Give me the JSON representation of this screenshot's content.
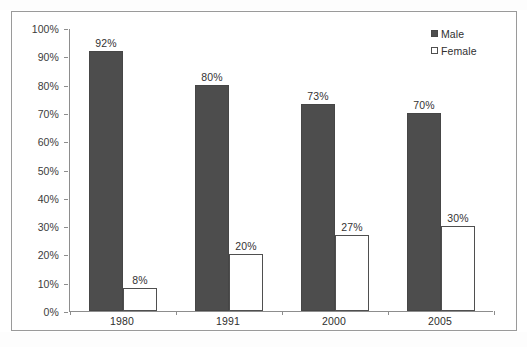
{
  "chart_data": {
    "type": "bar",
    "title": "",
    "subtitle": "",
    "xlabel": "",
    "ylabel": "",
    "categories": [
      "1980",
      "1991",
      "2000",
      "2005"
    ],
    "series": [
      {
        "name": "Male",
        "color": "#4d4d4d",
        "values": [
          92,
          80,
          73,
          70
        ],
        "value_labels": [
          "92%",
          "80%",
          "73%",
          "70%"
        ]
      },
      {
        "name": "Female",
        "color": "#ffffff",
        "values": [
          8,
          20,
          27,
          30
        ],
        "value_labels": [
          "8%",
          "20%",
          "27%",
          "30%"
        ]
      }
    ],
    "ylim": [
      0,
      100
    ],
    "ytick_values": [
      0,
      10,
      20,
      30,
      40,
      50,
      60,
      70,
      80,
      90,
      100
    ],
    "ytick_labels": [
      "0%",
      "10%",
      "20%",
      "30%",
      "40%",
      "50%",
      "60%",
      "70%",
      "80%",
      "90%",
      "100%"
    ],
    "grid": false,
    "legend_position": "top-right",
    "value_labels_shown": true
  },
  "axes": {
    "y": {
      "ticks": [
        {
          "label": "100%",
          "value": 100
        },
        {
          "label": "90%",
          "value": 90
        },
        {
          "label": "80%",
          "value": 80
        },
        {
          "label": "70%",
          "value": 70
        },
        {
          "label": "60%",
          "value": 60
        },
        {
          "label": "50%",
          "value": 50
        },
        {
          "label": "40%",
          "value": 40
        },
        {
          "label": "30%",
          "value": 30
        },
        {
          "label": "20%",
          "value": 20
        },
        {
          "label": "10%",
          "value": 10
        },
        {
          "label": "0%",
          "value": 0
        }
      ]
    },
    "x": {
      "ticks": [
        {
          "label": "1980"
        },
        {
          "label": "1991"
        },
        {
          "label": "2000"
        },
        {
          "label": "2005"
        }
      ]
    }
  },
  "legend": {
    "items": [
      {
        "label": "Male",
        "swatch": "filled-square",
        "color": "#4d4d4d"
      },
      {
        "label": "Female",
        "swatch": "hollow-square",
        "color": "#ffffff"
      }
    ]
  },
  "bars": [
    {
      "category": "1980",
      "series": "Male",
      "value": 92,
      "label": "92%"
    },
    {
      "category": "1980",
      "series": "Female",
      "value": 8,
      "label": "8%"
    },
    {
      "category": "1991",
      "series": "Male",
      "value": 80,
      "label": "80%"
    },
    {
      "category": "1991",
      "series": "Female",
      "value": 20,
      "label": "20%"
    },
    {
      "category": "2000",
      "series": "Male",
      "value": 73,
      "label": "73%"
    },
    {
      "category": "2000",
      "series": "Female",
      "value": 27,
      "label": "27%"
    },
    {
      "category": "2005",
      "series": "Male",
      "value": 70,
      "label": "70%"
    },
    {
      "category": "2005",
      "series": "Female",
      "value": 30,
      "label": "30%"
    }
  ],
  "colors": {
    "male_fill": "#4d4d4d",
    "female_fill": "#ffffff",
    "bar_border": "#4f4f4f",
    "axis_line": "#8d8d8d",
    "frame_border": "#9a9a9a",
    "text": "#303030",
    "background": "#ffffff"
  }
}
